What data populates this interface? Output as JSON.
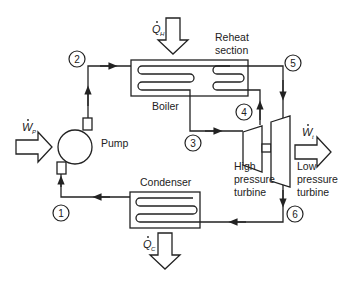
{
  "diagram": {
    "components": {
      "boiler": "Boiler",
      "reheat_line1": "Reheat",
      "reheat_line2": "section",
      "pump": "Pump",
      "condenser": "Condenser",
      "hp_turbine_line1": "High",
      "hp_turbine_line2": "pressure",
      "hp_turbine_line3": "turbine",
      "lp_turbine_line1": "Low",
      "lp_turbine_line2": "pressure",
      "lp_turbine_line3": "turbine"
    },
    "energy_flows": {
      "heat_in": {
        "symbol": "Q",
        "subscript": "H"
      },
      "heat_out": {
        "symbol": "Q",
        "subscript": "C"
      },
      "work_pump": {
        "symbol": "W",
        "subscript": "P"
      },
      "work_turbine": {
        "symbol": "W",
        "subscript": "t"
      }
    },
    "state_points": [
      "1",
      "2",
      "3",
      "4",
      "5",
      "6"
    ],
    "colors": {
      "stroke": "#222222",
      "background": "#ffffff"
    }
  }
}
